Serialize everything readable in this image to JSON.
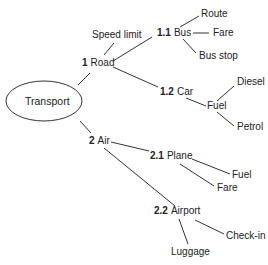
{
  "diagram": {
    "type": "mind-map",
    "center": {
      "label": "Transport"
    },
    "branches": [
      {
        "number": "1",
        "label": "Road",
        "leaves": [
          "Speed limit"
        ],
        "children": [
          {
            "number": "1.1",
            "label": "Bus",
            "leaves": [
              "Route",
              "Fare",
              "Bus stop"
            ]
          },
          {
            "number": "1.2",
            "label": "Car",
            "leaves": [
              {
                "label": "Fuel",
                "leaves": [
                  "Diesel",
                  "Petrol"
                ]
              }
            ]
          }
        ]
      },
      {
        "number": "2",
        "label": "Air",
        "children": [
          {
            "number": "2.1",
            "label": "Plane",
            "leaves": [
              "Fuel",
              "Fare"
            ]
          },
          {
            "number": "2.2",
            "label": "Airport",
            "leaves": [
              "Check-in",
              "Luggage"
            ]
          }
        ]
      }
    ]
  },
  "labels": {
    "center": "Transport",
    "road_num": "1",
    "road": "Road",
    "speed_limit": "Speed limit",
    "bus_num": "1.1",
    "bus": "Bus",
    "route": "Route",
    "bus_fare": "Fare",
    "bus_stop": "Bus stop",
    "car_num": "1.2",
    "car": "Car",
    "car_fuel": "Fuel",
    "diesel": "Diesel",
    "petrol": "Petrol",
    "air_num": "2",
    "air": "Air",
    "plane_num": "2.1",
    "plane": "Plane",
    "plane_fuel": "Fuel",
    "plane_fare": "Fare",
    "airport_num": "2.2",
    "airport": "Airport",
    "checkin": "Check-in",
    "luggage": "Luggage"
  }
}
